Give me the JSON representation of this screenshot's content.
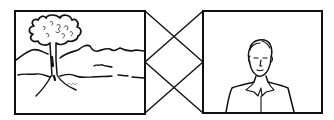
{
  "diagram": {
    "colors": {
      "line": "#111111",
      "background": "#ffffff"
    },
    "left_frame": {
      "subject": "landscape-with-tree",
      "elements": [
        "tree",
        "hills",
        "water-lines",
        "ground"
      ],
      "x": 15,
      "y": 11,
      "width": 130,
      "height": 103
    },
    "right_frame": {
      "subject": "portrait-of-man",
      "elements": [
        "head",
        "face",
        "shoulders",
        "collar"
      ],
      "x": 203,
      "y": 11,
      "width": 119,
      "height": 102
    },
    "connector": {
      "type": "crossed-lines",
      "shape": "diamond",
      "lines": 4
    }
  }
}
